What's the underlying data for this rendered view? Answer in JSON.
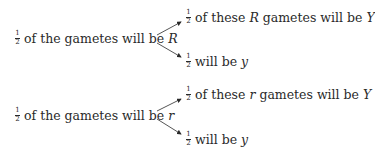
{
  "fraction": {
    "num": "1",
    "den": "2"
  },
  "groups": [
    {
      "parent": {
        "pre": "of the gametes will be",
        "allele": "R"
      },
      "children": [
        {
          "pre": "of these",
          "allele": "R",
          "post": "gametes will be",
          "result": "Y"
        },
        {
          "pre": "will be",
          "result": "y"
        }
      ]
    },
    {
      "parent": {
        "pre": "of the gametes will be",
        "allele": "r"
      },
      "children": [
        {
          "pre": "of these",
          "allele": "r",
          "post": "gametes will be",
          "result": "Y"
        },
        {
          "pre": "will be",
          "result": "y"
        }
      ]
    }
  ]
}
